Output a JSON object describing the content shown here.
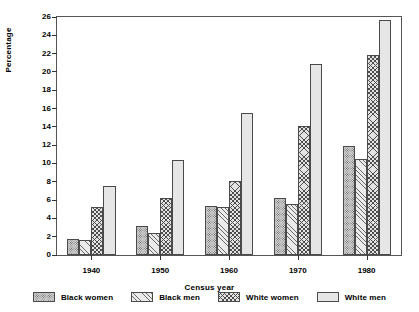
{
  "chart_data": {
    "type": "bar",
    "title": "",
    "xlabel": "Census year",
    "ylabel": "Percentage",
    "categories": [
      "1940",
      "1950",
      "1960",
      "1970",
      "1980"
    ],
    "ylim": [
      0,
      26
    ],
    "yticks": [
      0,
      2,
      4,
      6,
      8,
      10,
      12,
      14,
      16,
      18,
      20,
      22,
      24,
      26
    ],
    "grid": false,
    "legend_position": "bottom",
    "series": [
      {
        "name": "Black women",
        "pattern": "dense-dots",
        "values": [
          1.8,
          3.2,
          5.35,
          6.2,
          11.9
        ]
      },
      {
        "name": "Black men",
        "pattern": "diagonal",
        "values": [
          1.6,
          2.4,
          5.25,
          5.6,
          10.5
        ]
      },
      {
        "name": "White women",
        "pattern": "cross-hatch",
        "values": [
          5.25,
          6.2,
          8.05,
          14.1,
          21.9
        ]
      },
      {
        "name": "White men",
        "pattern": "fine-stipple",
        "values": [
          7.5,
          10.35,
          15.5,
          20.9,
          25.7
        ]
      }
    ]
  }
}
